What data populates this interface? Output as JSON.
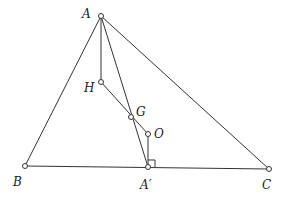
{
  "diagram": {
    "title": "",
    "colors": {
      "stroke": "#333333",
      "point_fill": "#ffffff",
      "label": "#222222"
    },
    "points": [
      {
        "id": "A",
        "label": "A",
        "x": 101,
        "y": 16,
        "lx": 82,
        "ly": 18
      },
      {
        "id": "B",
        "label": "B",
        "x": 25,
        "y": 166,
        "lx": 13,
        "ly": 186
      },
      {
        "id": "C",
        "label": "C",
        "x": 269,
        "y": 169,
        "lx": 262,
        "ly": 189
      },
      {
        "id": "H",
        "label": "H",
        "x": 101,
        "y": 82,
        "lx": 84,
        "ly": 92
      },
      {
        "id": "G",
        "label": "G",
        "x": 131,
        "y": 117,
        "lx": 136,
        "ly": 116
      },
      {
        "id": "O",
        "label": "O",
        "x": 148,
        "y": 134,
        "lx": 154,
        "ly": 138
      },
      {
        "id": "Ap",
        "label": "A′",
        "x": 148,
        "y": 167,
        "lx": 140,
        "ly": 189
      }
    ],
    "segments": [
      {
        "from": "A",
        "to": "B"
      },
      {
        "from": "A",
        "to": "C"
      },
      {
        "from": "B",
        "to": "C"
      },
      {
        "from": "A",
        "to": "H"
      },
      {
        "from": "A",
        "to": "Ap"
      },
      {
        "from": "H",
        "to": "O"
      },
      {
        "from": "O",
        "to": "Ap"
      }
    ],
    "right_angle": {
      "at": "Ap",
      "size": 7
    }
  }
}
